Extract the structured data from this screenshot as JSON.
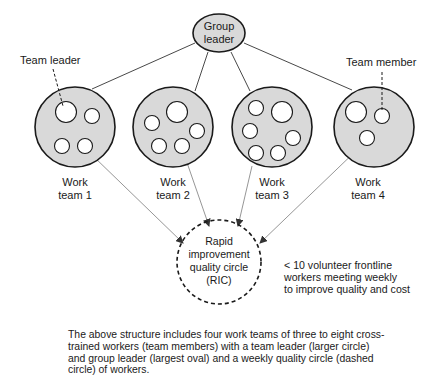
{
  "diagram": {
    "group_leader": {
      "line1": "Group",
      "line2": "leader"
    },
    "callouts": {
      "team_leader": "Team leader",
      "team_member": "Team member"
    },
    "teams": [
      {
        "line1": "Work",
        "line2": "team 1",
        "members": 4
      },
      {
        "line1": "Work",
        "line2": "team 2",
        "members": 5
      },
      {
        "line1": "Work",
        "line2": "team 3",
        "members": 6
      },
      {
        "line1": "Work",
        "line2": "team 4",
        "members": 3
      }
    ],
    "ric": {
      "line1": "Rapid",
      "line2": "improvement",
      "line3": "quality circle",
      "line4": "(RIC)"
    },
    "ric_note": {
      "line1": "< 10 volunteer frontline",
      "line2": "workers meeting weekly",
      "line3": "to improve quality and cost"
    },
    "caption": "The above structure includes four work teams of three to eight cross-trained workers (team members) with a team leader (larger circle) and group leader (largest oval) and a weekly quality circle (dashed circle) of workers.",
    "colors": {
      "fill": "#d9d9d9",
      "stroke": "#1a1a1a",
      "arrow": "#8a8a8a"
    }
  }
}
